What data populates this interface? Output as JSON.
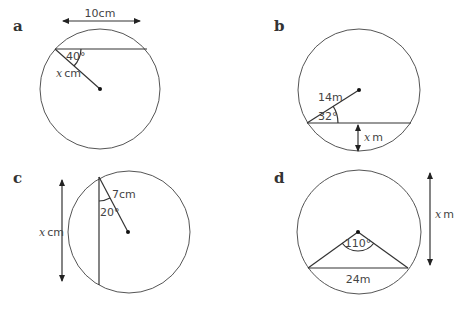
{
  "diagrams": [
    {
      "label": "a",
      "chord_length": "10cm",
      "angle": "40°",
      "radius": "cm",
      "radius_var": "x"
    },
    {
      "label": "b",
      "radius": "14m",
      "angle": "32°",
      "unknown": "m",
      "unknown_var": "x"
    },
    {
      "label": "c",
      "radius": "7cm",
      "angle": "20°",
      "unknown": "cm",
      "unknown_var": "x"
    },
    {
      "label": "d",
      "chord": "24m",
      "angle": "110°",
      "unknown": "m",
      "unknown_var": "x"
    }
  ],
  "colors": {
    "line": "#333333",
    "circle": "#555555",
    "background": "#ffffff"
  }
}
